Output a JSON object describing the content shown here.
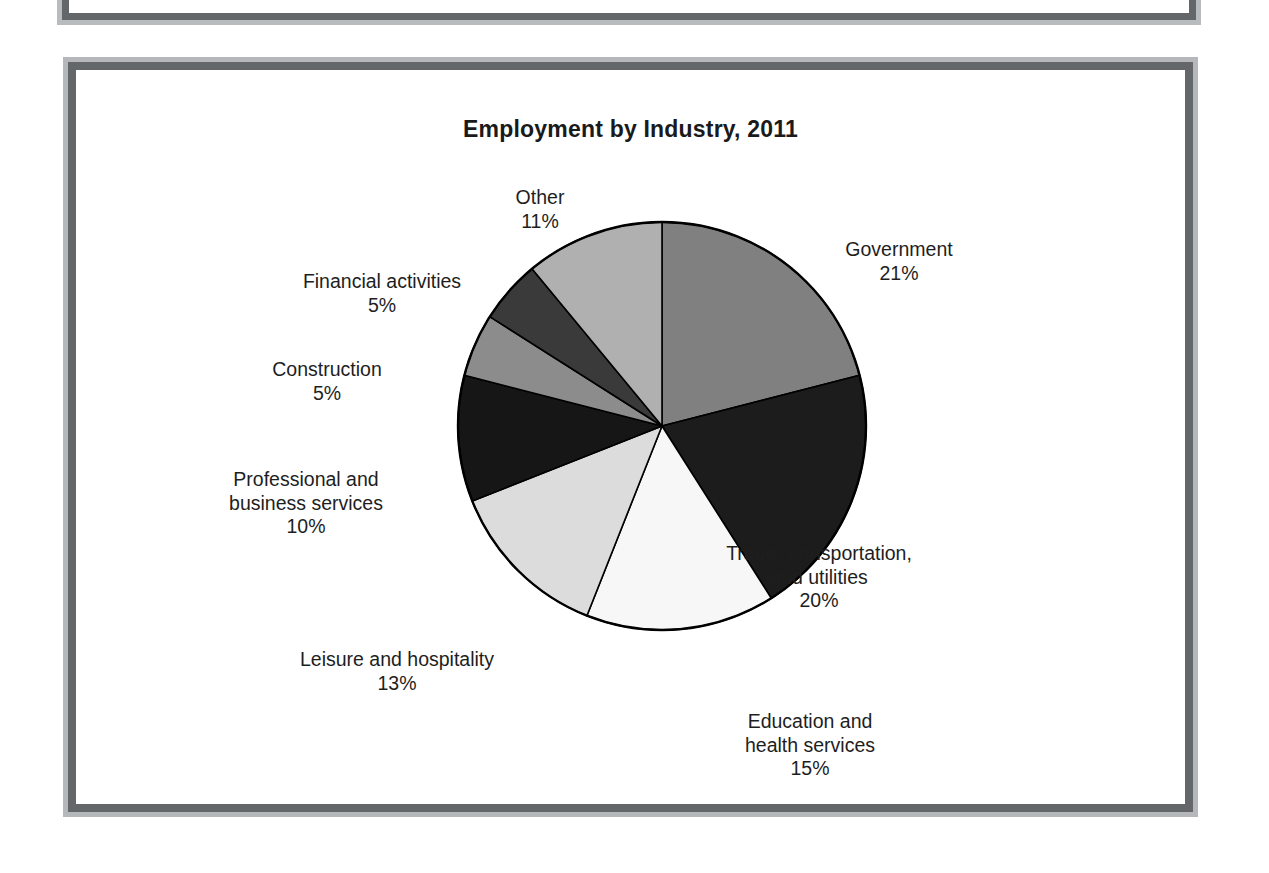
{
  "document": {
    "frame_outer_color": "#b5b8ba",
    "frame_inner_color": "#63676a",
    "background_color": "#ffffff"
  },
  "chart_data": {
    "type": "pie",
    "title": "Employment by Industry, 2011",
    "xlabel": "",
    "ylabel": "",
    "legend": "none",
    "labels_position": "outside-callout",
    "start_angle_deg": 0,
    "direction": "clockwise",
    "categories": [
      "Government",
      "Trade, transportation, and utilities",
      "Education and health services",
      "Leisure and hospitality",
      "Professional and business services",
      "Construction",
      "Financial activities",
      "Other"
    ],
    "values": [
      21,
      20,
      15,
      13,
      10,
      5,
      5,
      11
    ],
    "unit": "%",
    "slices": [
      {
        "name": "Government",
        "label_line1": "Government",
        "label_line2": "21%",
        "value": 21,
        "color": "#808080"
      },
      {
        "name": "Trade, transportation, and utilities",
        "label_line1": "Trade, transportation,",
        "label_line2": "and utilities",
        "label_line3": "20%",
        "value": 20,
        "color": "#1c1c1c"
      },
      {
        "name": "Education and health services",
        "label_line1": "Education and",
        "label_line2": "health services",
        "label_line3": "15%",
        "value": 15,
        "color": "#f7f7f7"
      },
      {
        "name": "Leisure and hospitality",
        "label_line1": "Leisure and hospitality",
        "label_line2": "13%",
        "value": 13,
        "color": "#dcdcdc"
      },
      {
        "name": "Professional and business services",
        "label_line1": "Professional and",
        "label_line2": "business services",
        "label_line3": "10%",
        "value": 10,
        "color": "#161616"
      },
      {
        "name": "Construction",
        "label_line1": "Construction",
        "label_line2": "5%",
        "value": 5,
        "color": "#8c8c8c"
      },
      {
        "name": "Financial activities",
        "label_line1": "Financial activities",
        "label_line2": "5%",
        "value": 5,
        "color": "#3a3a3a"
      },
      {
        "name": "Other",
        "label_line1": "Other",
        "label_line2": "11%",
        "value": 11,
        "color": "#b0b0b0"
      }
    ]
  }
}
